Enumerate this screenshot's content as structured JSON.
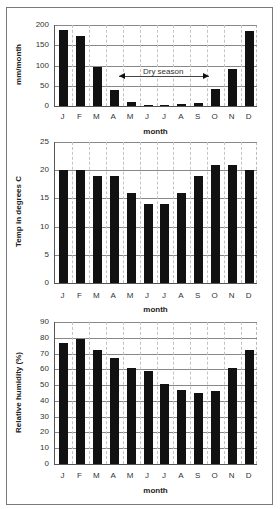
{
  "chart_data": [
    {
      "type": "bar",
      "title": "",
      "xlabel": "month",
      "ylabel": "mm/month",
      "categories": [
        "J",
        "F",
        "M",
        "A",
        "M",
        "J",
        "J",
        "A",
        "S",
        "O",
        "N",
        "D"
      ],
      "values": [
        187,
        173,
        97,
        39,
        9,
        2,
        2,
        4,
        8,
        43,
        92,
        184
      ],
      "ylim": [
        0,
        200
      ],
      "yticks": [
        0,
        50,
        100,
        150,
        200
      ],
      "grid": true,
      "annotations": [
        {
          "text": "Dry season",
          "type": "double-arrow",
          "from": "A",
          "to": "O",
          "y": 75
        }
      ]
    },
    {
      "type": "bar",
      "title": "",
      "xlabel": "month",
      "ylabel": "Temp in degrees C",
      "categories": [
        "J",
        "F",
        "M",
        "A",
        "M",
        "J",
        "J",
        "A",
        "S",
        "O",
        "N",
        "D"
      ],
      "values": [
        20,
        20,
        19,
        19,
        16,
        14,
        14,
        16,
        19,
        21,
        21,
        20
      ],
      "ylim": [
        0,
        25
      ],
      "yticks": [
        0,
        5,
        10,
        15,
        20,
        25
      ],
      "grid": true
    },
    {
      "type": "bar",
      "title": "",
      "xlabel": "month",
      "ylabel": "Relative humidity (%)",
      "categories": [
        "J",
        "F",
        "M",
        "A",
        "M",
        "J",
        "J",
        "A",
        "S",
        "O",
        "N",
        "D"
      ],
      "values": [
        77,
        79,
        72,
        67,
        61,
        59,
        51,
        47,
        45,
        46,
        61,
        72
      ],
      "ylim": [
        0,
        90
      ],
      "yticks": [
        0,
        10,
        20,
        30,
        40,
        50,
        60,
        70,
        80,
        90
      ],
      "grid": true
    }
  ],
  "colors": {
    "bar": "#111111",
    "grid": "#888888",
    "frame": "#7a7a7a"
  },
  "charts": {
    "rain": {
      "ylabel": "mm/month",
      "xlabel": "month",
      "annotation": "Dry season"
    },
    "temp": {
      "ylabel": "Temp in degrees C",
      "xlabel": "month"
    },
    "humidity": {
      "ylabel": "Relative humidity (%)",
      "xlabel": "month"
    }
  }
}
